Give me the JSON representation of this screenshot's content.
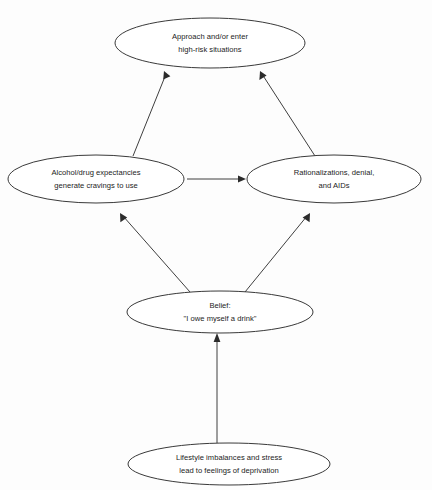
{
  "diagram": {
    "title": "",
    "background_color": "#fdfdfd",
    "line_color": "#3f3f3f",
    "text_color": "#1c1c1c",
    "nodes": [
      {
        "id": "high-risk",
        "shape": "ellipse",
        "lines": [
          "Approach and/or enter",
          "high-risk situations"
        ],
        "line1": "Approach and/or enter",
        "line2": "high-risk situations",
        "cx": 210,
        "cy": 43,
        "rx": 95,
        "ry": 25
      },
      {
        "id": "expectancies",
        "shape": "ellipse",
        "lines": [
          "Alcohol/drug expectancies",
          "generate cravings to use"
        ],
        "line1": "Alcohol/drug expectancies",
        "line2": "generate cravings to use",
        "cx": 96,
        "cy": 179,
        "rx": 88,
        "ry": 24
      },
      {
        "id": "rationalizations",
        "shape": "ellipse",
        "lines": [
          "Rationalizations, denial,",
          "and AIDs"
        ],
        "line1": "Rationalizations, denial,",
        "line2": "and AIDs",
        "cx": 334,
        "cy": 179,
        "rx": 87,
        "ry": 24
      },
      {
        "id": "belief",
        "shape": "ellipse",
        "lines": [
          "Belief:",
          "\"I owe myself a drink\""
        ],
        "line1": "Belief:",
        "line2": "\"I owe myself a drink\"",
        "cx": 220,
        "cy": 312,
        "rx": 93,
        "ry": 21
      },
      {
        "id": "lifestyle",
        "shape": "ellipse",
        "lines": [
          "Lifestyle imbalances and stress",
          "lead to feelings of deprivation"
        ],
        "line1": "Lifestyle imbalances and stress",
        "line2": "lead to feelings of deprivation",
        "cx": 229,
        "cy": 464,
        "rx": 101,
        "ry": 21
      }
    ],
    "edges": [
      {
        "id": "expectancies-to-high-risk",
        "from": "expectancies",
        "to": "high-risk",
        "arrowhead": "target"
      },
      {
        "id": "rationalizations-to-high-risk",
        "from": "rationalizations",
        "to": "high-risk",
        "arrowhead": "target"
      },
      {
        "id": "expectancies-to-rationalizations",
        "from": "expectancies",
        "to": "rationalizations",
        "arrowhead": "target"
      },
      {
        "id": "belief-to-expectancies",
        "from": "belief",
        "to": "expectancies",
        "arrowhead": "target"
      },
      {
        "id": "belief-to-rationalizations",
        "from": "belief",
        "to": "rationalizations",
        "arrowhead": "target"
      },
      {
        "id": "lifestyle-to-belief",
        "from": "lifestyle",
        "to": "belief",
        "arrowhead": "target"
      }
    ]
  }
}
